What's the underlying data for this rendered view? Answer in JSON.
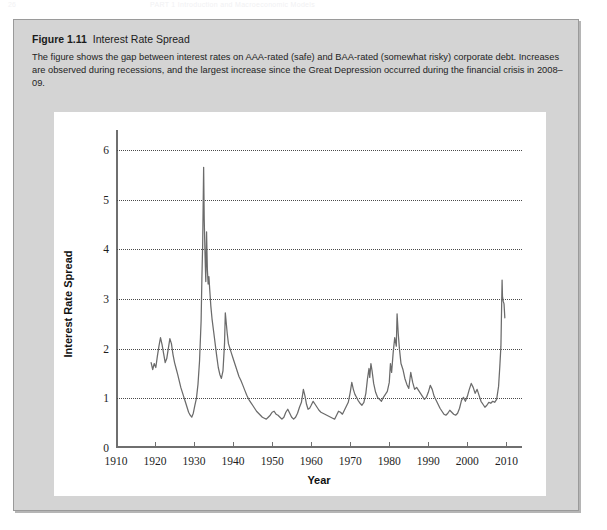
{
  "page_header": {
    "folio": "26",
    "running_title": "PART 1  Introduction and Macroeconomic Models"
  },
  "figure": {
    "number_label": "Figure 1.11",
    "title": "Interest Rate Spread",
    "caption": "The figure shows the gap between interest rates on AAA-rated (safe) and BAA-rated (somewhat risky) corporate debt. Increases are observed during recessions, and the largest increase since the Great Depression occurred during the financial crisis in 2008–09.",
    "panel_background": "#ffffff",
    "box_background": "#d4d4d4",
    "box_border": "#9a9a9a"
  },
  "chart_data": {
    "type": "line",
    "title": "Interest Rate Spread",
    "xlabel": "Year",
    "ylabel": "Interest Rate Spread",
    "xlim": [
      1910,
      2014
    ],
    "ylim": [
      0,
      6.4
    ],
    "xticks": [
      1910,
      1920,
      1930,
      1940,
      1950,
      1960,
      1970,
      1980,
      1990,
      2000,
      2010
    ],
    "xtick_labels": [
      "1910",
      "1920",
      "1930",
      "1940",
      "1950",
      "1960",
      "1970",
      "1980",
      "1990",
      "2000",
      "2010"
    ],
    "yticks": [
      0,
      1,
      2,
      3,
      4,
      5,
      6
    ],
    "ytick_labels": [
      "0",
      "1",
      "2",
      "3",
      "4",
      "5",
      "6"
    ],
    "grid": "horizontal-dotted",
    "legend": null,
    "line_color": "#6b6b6b",
    "line_width": 1.25,
    "series": [
      {
        "name": "BAA minus AAA corporate bond spread",
        "x": [
          1919.0,
          1919.4,
          1919.8,
          1920.2,
          1920.6,
          1921.0,
          1921.4,
          1921.8,
          1922.2,
          1922.6,
          1923.0,
          1923.4,
          1923.8,
          1924.2,
          1924.6,
          1925.0,
          1925.4,
          1925.8,
          1926.2,
          1926.6,
          1927.0,
          1927.4,
          1927.8,
          1928.2,
          1928.6,
          1929.0,
          1929.4,
          1929.8,
          1930.2,
          1930.6,
          1931.0,
          1931.4,
          1931.8,
          1932.0,
          1932.2,
          1932.45,
          1932.6,
          1932.8,
          1933.0,
          1933.2,
          1933.4,
          1933.6,
          1933.8,
          1934.0,
          1934.3,
          1934.6,
          1935.0,
          1935.4,
          1935.8,
          1936.2,
          1936.6,
          1937.0,
          1937.4,
          1937.8,
          1938.0,
          1938.2,
          1938.5,
          1938.8,
          1939.2,
          1939.6,
          1940.0,
          1940.5,
          1941.0,
          1941.5,
          1942.0,
          1942.5,
          1943.0,
          1943.5,
          1944.0,
          1944.5,
          1945.0,
          1945.5,
          1946.0,
          1946.5,
          1947.0,
          1947.5,
          1948.0,
          1948.5,
          1949.0,
          1949.5,
          1950.0,
          1950.5,
          1951.0,
          1951.5,
          1952.0,
          1952.5,
          1953.0,
          1953.5,
          1954.0,
          1954.5,
          1955.0,
          1955.5,
          1956.0,
          1956.5,
          1957.0,
          1957.5,
          1958.0,
          1958.4,
          1958.8,
          1959.2,
          1959.6,
          1960.0,
          1960.5,
          1961.0,
          1961.5,
          1962.0,
          1962.5,
          1963.0,
          1963.5,
          1964.0,
          1964.5,
          1965.0,
          1965.5,
          1966.0,
          1966.5,
          1967.0,
          1967.5,
          1968.0,
          1968.5,
          1969.0,
          1969.5,
          1970.0,
          1970.4,
          1970.8,
          1971.2,
          1971.6,
          1972.0,
          1972.5,
          1973.0,
          1973.5,
          1974.0,
          1974.4,
          1974.8,
          1975.0,
          1975.3,
          1975.6,
          1976.0,
          1976.5,
          1977.0,
          1977.5,
          1978.0,
          1978.5,
          1979.0,
          1979.5,
          1980.0,
          1980.3,
          1980.6,
          1981.0,
          1981.4,
          1981.8,
          1982.0,
          1982.3,
          1982.6,
          1983.0,
          1983.5,
          1984.0,
          1984.5,
          1985.0,
          1985.5,
          1986.0,
          1986.5,
          1987.0,
          1987.5,
          1988.0,
          1988.5,
          1989.0,
          1989.5,
          1990.0,
          1990.5,
          1991.0,
          1991.5,
          1992.0,
          1992.5,
          1993.0,
          1993.5,
          1994.0,
          1994.5,
          1995.0,
          1995.5,
          1996.0,
          1996.5,
          1997.0,
          1997.5,
          1998.0,
          1998.5,
          1999.0,
          1999.5,
          2000.0,
          2000.5,
          2001.0,
          2001.5,
          2002.0,
          2002.5,
          2003.0,
          2003.5,
          2004.0,
          2004.5,
          2005.0,
          2005.5,
          2006.0,
          2006.5,
          2007.0,
          2007.5,
          2008.0,
          2008.3,
          2008.6,
          2008.9,
          2009.0,
          2009.2,
          2009.4,
          2009.6
        ],
        "y": [
          1.72,
          1.58,
          1.7,
          1.62,
          1.85,
          2.05,
          2.22,
          2.08,
          1.9,
          1.72,
          1.8,
          2.0,
          2.2,
          2.1,
          1.88,
          1.72,
          1.6,
          1.48,
          1.35,
          1.22,
          1.12,
          1.02,
          0.92,
          0.82,
          0.72,
          0.66,
          0.62,
          0.7,
          0.86,
          1.0,
          1.28,
          1.75,
          2.55,
          3.4,
          4.1,
          5.65,
          4.6,
          3.9,
          3.35,
          4.35,
          3.6,
          3.3,
          3.45,
          3.2,
          2.85,
          2.6,
          2.35,
          2.1,
          1.85,
          1.62,
          1.48,
          1.4,
          1.55,
          2.1,
          2.72,
          2.55,
          2.3,
          2.1,
          2.0,
          1.9,
          1.8,
          1.68,
          1.56,
          1.44,
          1.36,
          1.26,
          1.16,
          1.06,
          0.98,
          0.92,
          0.86,
          0.8,
          0.74,
          0.7,
          0.66,
          0.62,
          0.6,
          0.58,
          0.62,
          0.66,
          0.72,
          0.74,
          0.68,
          0.66,
          0.62,
          0.58,
          0.62,
          0.72,
          0.78,
          0.7,
          0.62,
          0.58,
          0.62,
          0.7,
          0.82,
          0.92,
          1.18,
          1.05,
          0.88,
          0.78,
          0.8,
          0.86,
          0.94,
          0.88,
          0.82,
          0.76,
          0.72,
          0.7,
          0.68,
          0.66,
          0.64,
          0.62,
          0.6,
          0.58,
          0.66,
          0.74,
          0.72,
          0.68,
          0.76,
          0.84,
          0.92,
          1.12,
          1.32,
          1.18,
          1.08,
          1.02,
          0.96,
          0.9,
          0.86,
          0.92,
          1.1,
          1.38,
          1.6,
          1.42,
          1.7,
          1.55,
          1.3,
          1.12,
          1.02,
          0.98,
          0.94,
          1.02,
          1.08,
          1.14,
          1.32,
          1.7,
          1.52,
          1.92,
          2.22,
          2.05,
          2.7,
          2.3,
          2.0,
          1.7,
          1.58,
          1.4,
          1.28,
          1.2,
          1.52,
          1.32,
          1.18,
          1.22,
          1.16,
          1.1,
          1.04,
          0.98,
          1.02,
          1.12,
          1.26,
          1.18,
          1.04,
          0.96,
          0.88,
          0.8,
          0.74,
          0.68,
          0.66,
          0.7,
          0.76,
          0.72,
          0.68,
          0.66,
          0.7,
          0.8,
          0.96,
          1.02,
          0.94,
          1.04,
          1.18,
          1.3,
          1.22,
          1.1,
          1.18,
          1.06,
          0.94,
          0.88,
          0.82,
          0.86,
          0.92,
          0.9,
          0.94,
          0.92,
          0.98,
          1.24,
          1.62,
          2.05,
          3.38,
          3.05,
          2.95,
          2.9,
          2.62
        ]
      }
    ]
  }
}
